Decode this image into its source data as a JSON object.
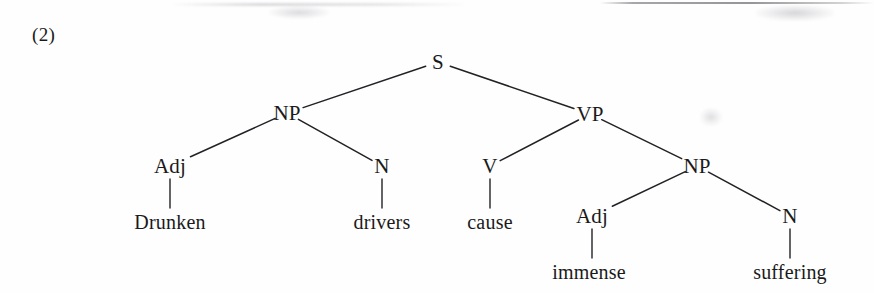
{
  "figure": {
    "example_number": "(2)",
    "sentence": "Drunken drivers cause immense suffering",
    "ink_color": "#222226",
    "background_color": "#fefefe"
  },
  "tree": {
    "nodes": [
      {
        "id": "s",
        "label": "S",
        "x": 438,
        "y": 62,
        "kind": "phrase"
      },
      {
        "id": "np1",
        "label": "NP",
        "x": 287,
        "y": 113,
        "kind": "phrase"
      },
      {
        "id": "vp",
        "label": "VP",
        "x": 590,
        "y": 114,
        "kind": "phrase"
      },
      {
        "id": "adj1",
        "label": "Adj",
        "x": 170,
        "y": 166,
        "kind": "pos"
      },
      {
        "id": "n1",
        "label": "N",
        "x": 382,
        "y": 166,
        "kind": "pos"
      },
      {
        "id": "v",
        "label": "V",
        "x": 490,
        "y": 166,
        "kind": "pos"
      },
      {
        "id": "np2",
        "label": "NP",
        "x": 697,
        "y": 166,
        "kind": "phrase"
      },
      {
        "id": "adj2",
        "label": "Adj",
        "x": 592,
        "y": 216,
        "kind": "pos"
      },
      {
        "id": "n2",
        "label": "N",
        "x": 790,
        "y": 216,
        "kind": "pos"
      }
    ],
    "terminals": [
      {
        "id": "w-drunken",
        "label": "Drunken",
        "x": 170,
        "y": 222,
        "parent": "adj1"
      },
      {
        "id": "w-drivers",
        "label": "drivers",
        "x": 382,
        "y": 222,
        "parent": "n1"
      },
      {
        "id": "w-cause",
        "label": "cause",
        "x": 490,
        "y": 222,
        "parent": "v"
      },
      {
        "id": "w-immense",
        "label": "immense",
        "x": 589,
        "y": 272,
        "parent": "adj2"
      },
      {
        "id": "w-suffering",
        "label": "suffering",
        "x": 790,
        "y": 272,
        "parent": "n2"
      }
    ],
    "branches": [
      {
        "from": "s",
        "to": "np1"
      },
      {
        "from": "s",
        "to": "vp"
      },
      {
        "from": "np1",
        "to": "adj1"
      },
      {
        "from": "np1",
        "to": "n1"
      },
      {
        "from": "vp",
        "to": "v"
      },
      {
        "from": "vp",
        "to": "np2"
      },
      {
        "from": "np2",
        "to": "adj2"
      },
      {
        "from": "np2",
        "to": "n2"
      }
    ],
    "stems": [
      {
        "node": "adj1",
        "terminal": "w-drunken"
      },
      {
        "node": "n1",
        "terminal": "w-drivers"
      },
      {
        "node": "v",
        "terminal": "w-cause"
      },
      {
        "node": "adj2",
        "terminal": "w-immense"
      },
      {
        "node": "n2",
        "terminal": "w-suffering"
      }
    ]
  }
}
